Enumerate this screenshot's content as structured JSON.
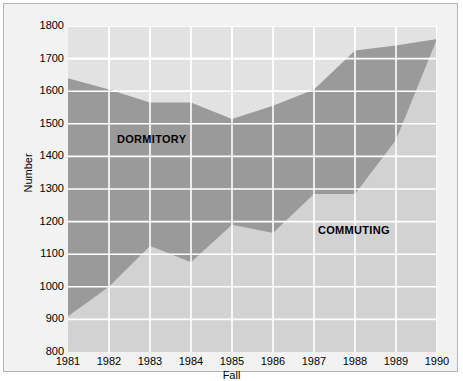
{
  "chart_data": {
    "type": "area",
    "title": "",
    "subtitle": "",
    "xlabel": "Fall",
    "ylabel": "Number",
    "stacked": true,
    "grid": true,
    "legend_position": "inline-annotations",
    "categories": [
      "1981",
      "1982",
      "1983",
      "1984",
      "1985",
      "1986",
      "1987",
      "1988",
      "1989",
      "1990"
    ],
    "x": [
      1981,
      1982,
      1983,
      1984,
      1985,
      1986,
      1987,
      1988,
      1989,
      1990
    ],
    "xlim": [
      1981,
      1990
    ],
    "ylim": [
      800,
      1800
    ],
    "ytick_labels": [
      "1800",
      "1700",
      "1600",
      "1500",
      "1400",
      "1300",
      "1200",
      "1100",
      "1000",
      "900",
      "800"
    ],
    "ytick_values": [
      1800,
      1700,
      1600,
      1500,
      1400,
      1300,
      1200,
      1100,
      1000,
      900,
      800
    ],
    "xtick_labels": [
      "1981",
      "1982",
      "1983",
      "1984",
      "1985",
      "1986",
      "1987",
      "1988",
      "1989",
      "1990"
    ],
    "series": [
      {
        "name": "COMMUTING",
        "color": "#d2d2d2",
        "values": [
          910,
          1000,
          1125,
          1075,
          1190,
          1165,
          1285,
          1285,
          1450,
          1760
        ]
      },
      {
        "name": "DORMITORY",
        "color": "#9a9a9a",
        "values": [
          730,
          605,
          440,
          490,
          325,
          390,
          320,
          440,
          290,
          0
        ]
      }
    ],
    "cumulative_top": [
      1640,
      1605,
      1565,
      1565,
      1515,
      1555,
      1605,
      1725,
      1740,
      1760
    ],
    "annotations": [
      {
        "text": "DORMITORY",
        "x": 1982.3,
        "y": 1450
      },
      {
        "text": "COMMUTING",
        "x": 1987.5,
        "y": 1170
      }
    ]
  },
  "colors": {
    "page_background": "#ffffff",
    "figure_background": "#f2f2f2",
    "plot_background": "#e2e2e2",
    "commuting_fill": "#d2d2d2",
    "dormitory_fill": "#9a9a9a",
    "gridline": "#ffffff",
    "frame_border": "#b4b4b4",
    "text": "#000000"
  }
}
